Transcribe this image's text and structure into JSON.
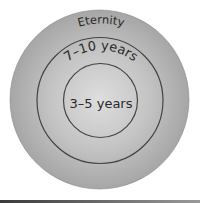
{
  "diagram": {
    "type": "concentric-circles",
    "rings": [
      {
        "label": "Eternity",
        "radius": 90
      },
      {
        "label": "7–10 years",
        "radius": 63
      },
      {
        "label": "3–5 years",
        "radius": 37
      }
    ],
    "colors": {
      "fill_outer": "#a9a9a9",
      "fill_center": "#dcdcdc",
      "stroke": "#444444",
      "text": "#2a2a2a"
    }
  }
}
